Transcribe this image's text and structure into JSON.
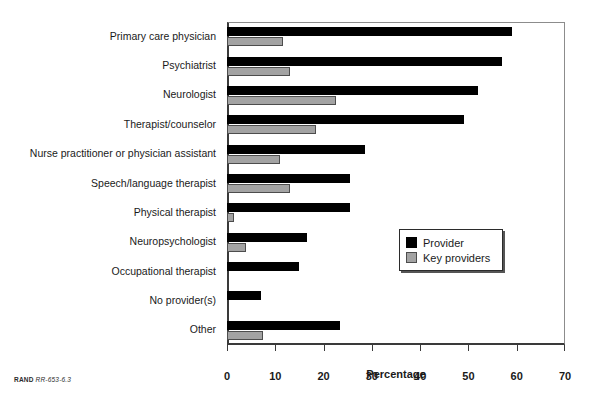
{
  "source_credit": {
    "brand": "RAND",
    "document_id": "RR-653-6.3"
  },
  "legend": {
    "position": "inside-right-middle",
    "entries": [
      {
        "label": "Provider",
        "color": "#000000"
      },
      {
        "label": "Key providers",
        "color": "#a3a3a3"
      }
    ]
  },
  "chart_data": {
    "type": "bar",
    "orientation": "horizontal",
    "title": "",
    "subtitle": "",
    "xlabel": "Percentage",
    "ylabel": "",
    "xlim": [
      0,
      70
    ],
    "xticks": [
      0,
      10,
      20,
      30,
      40,
      50,
      60,
      70
    ],
    "xtick_labels": [
      "0",
      "10",
      "20",
      "30",
      "40",
      "50",
      "60",
      "70"
    ],
    "grid": false,
    "legend_position": "center-right",
    "categories": [
      "Primary care physician",
      "Psychiatrist",
      "Neurologist",
      "Therapist/counselor",
      "Nurse practitioner or physician assistant",
      "Speech/language therapist",
      "Physical therapist",
      "Neuropsychologist",
      "Occupational therapist",
      "No provider(s)",
      "Other"
    ],
    "series": [
      {
        "name": "Provider",
        "color": "#000000",
        "values": [
          59,
          57,
          52,
          49,
          28.5,
          25.5,
          25.5,
          16.5,
          15,
          7,
          23.5
        ]
      },
      {
        "name": "Key providers",
        "color": "#a3a3a3",
        "values": [
          11.5,
          13,
          22.5,
          18.5,
          11,
          13,
          1.5,
          4,
          0,
          0,
          7.5
        ]
      }
    ]
  }
}
